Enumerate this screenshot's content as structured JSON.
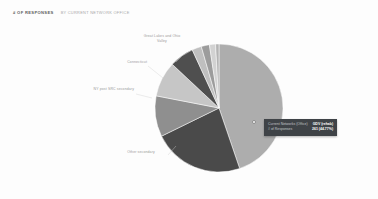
{
  "header": {
    "title": "# OF RESPONSES",
    "subtitle": "BY CURRENT NETWORK OFFICE"
  },
  "tooltip": {
    "row1_key": "Current Networks (Office)",
    "row1_value": "GDV (rehab)",
    "row2_key": "# of Responses",
    "row2_value": "261 (44.77%)"
  },
  "labels": {
    "great_lakes": "Great Lakes and Ohio Valley",
    "connecticut": "Connecticut",
    "ny_metro": "NY post SRC secondary",
    "other": "Other secondary"
  },
  "colors": {
    "background": "#fdfdfd",
    "title": "#5d5d5d",
    "subtitle": "#a9a9a9",
    "label": "#9a9a9a",
    "tooltip_bg": "#3f4347",
    "tooltip_text": "#ffffff"
  },
  "chart_data": {
    "type": "pie",
    "title": "# of Responses by Current Network Office",
    "xlabel": "",
    "ylabel": "# of Responses",
    "legend_position": "none",
    "grid": false,
    "total_responses": 583,
    "categories": [
      "GDV (rehab)",
      "Other secondary",
      "NY post SRC secondary",
      "Connecticut",
      "Great Lakes and Ohio Valley",
      "Segment 6",
      "Segment 7",
      "Segment 8",
      "Segment 9"
    ],
    "values": [
      261,
      134,
      60,
      52,
      36,
      14,
      12,
      9,
      5
    ],
    "percentages": [
      44.77,
      22.98,
      10.29,
      8.92,
      6.18,
      2.4,
      2.06,
      1.54,
      0.86
    ],
    "slice_colors": [
      "#adadad",
      "#4a4a4a",
      "#8f8f8f",
      "#c6c6c6",
      "#4f4f4f",
      "#bfbfbf",
      "#9c9c9c",
      "#d2d2d2",
      "#b4b4b4"
    ],
    "start_angle_deg": 0,
    "direction": "clockwise",
    "highlighted_slice": "GDV (rehab)"
  }
}
